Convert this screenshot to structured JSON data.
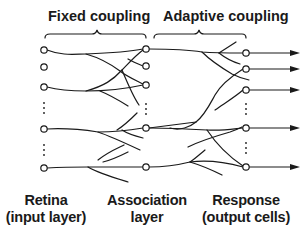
{
  "headers": {
    "fixed": "Fixed coupling",
    "adaptive": "Adaptive coupling"
  },
  "layers": {
    "retina": {
      "line1": "Retina",
      "line2": "(input layer)"
    },
    "association": {
      "line1": "Association",
      "line2": "layer"
    },
    "response": {
      "line1": "Response",
      "line2": "(output cells)"
    }
  },
  "colors": {
    "ink": "#1a1a1a",
    "background": "#ffffff"
  }
}
